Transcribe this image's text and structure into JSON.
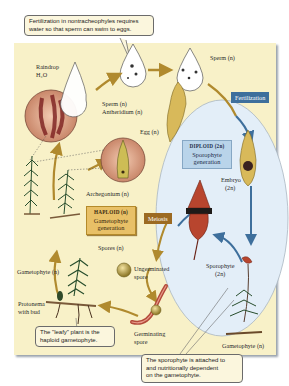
{
  "diagram": {
    "type": "moss life cycle",
    "colors": {
      "panel_background": "#f8f1c8",
      "diploid_ellipse": "#e3eef8",
      "haploid_arrow": "#b08a2e",
      "diploid_arrow": "#3e6f9c",
      "fertilization_tag": "#3e6f9c",
      "meiosis_tag": "#9c6a22",
      "haploid_box": "#e8c067",
      "diploid_box": "#b9d4ea"
    },
    "callouts": {
      "top": "Fertilization in nontracheophyles requires water so that sperm can swim to eggs.",
      "top_line1": "Fertilization in nontracheophyles requires",
      "top_line2": "water so that sperm can swim to eggs.",
      "leafy_line1": "The \"leafy\" plant is the",
      "leafy_line2": "haploid gametophyte.",
      "sporophyte_line1": "The sporophyte is attached to",
      "sporophyte_line2": "and nutritionally dependent",
      "sporophyte_line3": "on the gametophyte."
    },
    "stage_boxes": {
      "haploid": {
        "ploidy": "HAPLOID (n)",
        "line1": "Gametophyte",
        "line2": "generation"
      },
      "diploid": {
        "ploidy": "DIPLOID (2n)",
        "line1": "Sporophyte",
        "line2": "generation"
      }
    },
    "process_tags": {
      "fertilization": "Fertilization",
      "meiosis": "Meiosis"
    },
    "labels": {
      "raindrop": "Raindrop",
      "h2o": "H₂O",
      "sperm_antheridium": "Sperm (n)",
      "antheridium": "Antheridium (n)",
      "sperm_top": "Sperm (n)",
      "egg": "Egg (n)",
      "archegonium": "Archegonium (n)",
      "embryo": "Embryo",
      "embryo_ploidy": "(2n)",
      "sporophyte": "Sporophyte",
      "sporophyte_ploidy": "(2n)",
      "spores": "Spores (n)",
      "ungerminated_1": "Ungerminated",
      "ungerminated_2": "spore",
      "germinating_1": "Germinating",
      "germinating_2": "spore",
      "gametophyte_left": "Gametophyte (n)",
      "protonema_1": "Protonema",
      "protonema_2": "with bud",
      "gametophyte_right": "Gametophyte (n)"
    }
  }
}
